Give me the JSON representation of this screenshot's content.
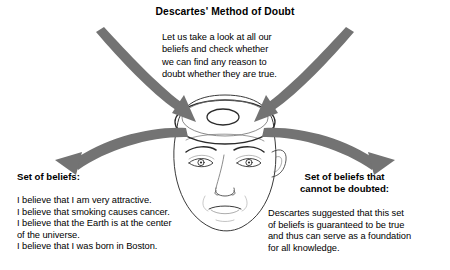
{
  "figure": {
    "title": "Descartes' Method of Doubt",
    "center_caption": "Let us take a look at all our\nbeliefs and check whether\nwe can find any reason to\ndoubt whether they are true.",
    "left": {
      "heading": "Set of beliefs:",
      "body": "I believe that I am very attractive.\nI believe that smoking causes cancer.\nI believe that the Earth is at the center\nof the universe.\nI believe that I was born in Boston."
    },
    "right": {
      "heading": "Set of beliefs that\ncannot be doubted:",
      "body": "Descartes suggested that this set\nof beliefs is guaranteed to be true\nand thus can serve as a foundation\nfor all knowledge."
    },
    "illustration": {
      "name": "head-with-open-skull",
      "arrows": [
        {
          "name": "arrow-out-left",
          "direction": "from-head-to-left"
        },
        {
          "name": "arrow-in-left",
          "direction": "from-left-into-head"
        },
        {
          "name": "arrow-out-right",
          "direction": "from-head-to-right"
        },
        {
          "name": "arrow-in-right",
          "direction": "from-right-into-head"
        }
      ]
    },
    "colors": {
      "arrow_gray": "#737373",
      "line_dark": "#2b2b2b",
      "line_light": "#9a9a9a",
      "text": "#000000",
      "background": "#ffffff"
    }
  }
}
